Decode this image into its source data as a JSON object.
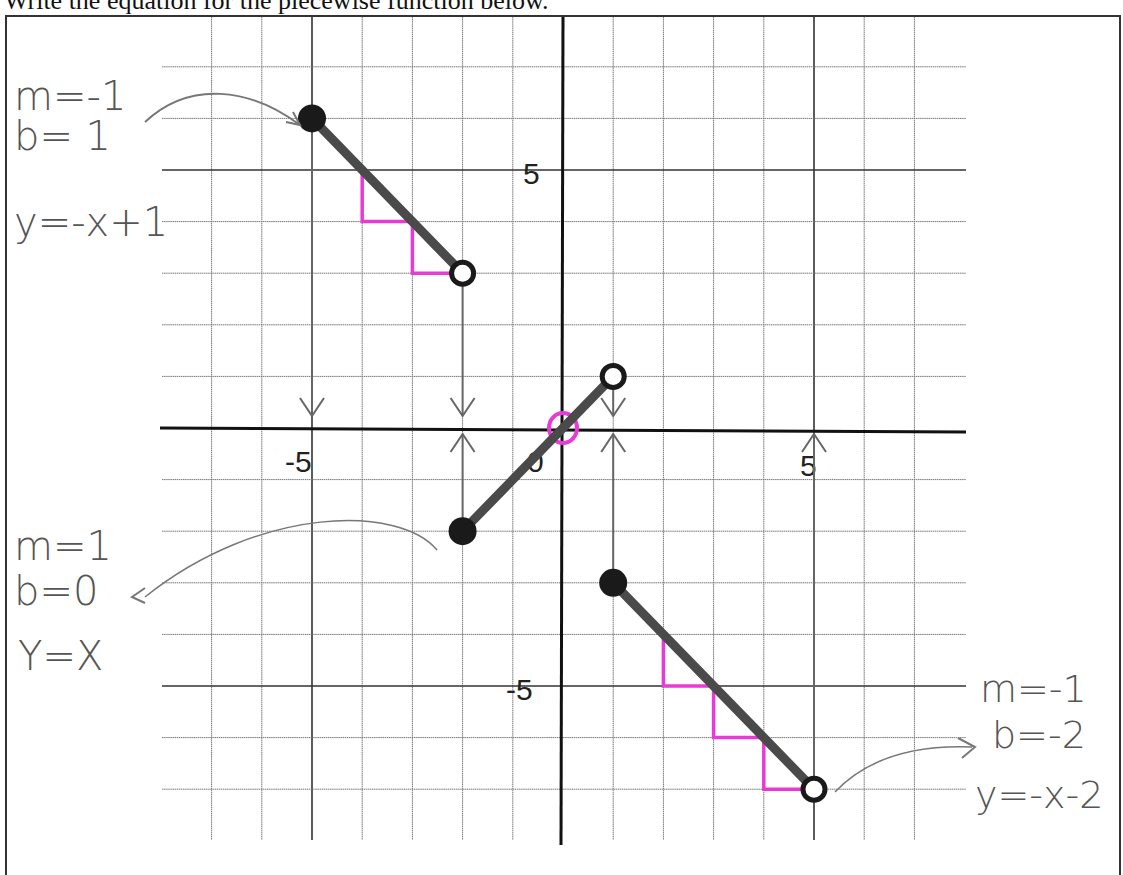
{
  "prompt": "Write the equation for the piecewise function below.",
  "chart_data": {
    "type": "line",
    "title": "Write the equation for the piecewise function below.",
    "xlabel": "",
    "ylabel": "",
    "xlim": [
      -8,
      8
    ],
    "ylim": [
      -8,
      8
    ],
    "grid": true,
    "tick_labels": {
      "x": [
        "-5",
        "0",
        "5"
      ],
      "y": [
        "5",
        "-5"
      ]
    },
    "series": [
      {
        "name": "piece 1",
        "x": [
          -5,
          -2
        ],
        "y": [
          6,
          3
        ],
        "start": "closed",
        "end": "open",
        "equation": "y=-x+1",
        "m": "-1",
        "b": "1"
      },
      {
        "name": "piece 2",
        "x": [
          -2,
          1
        ],
        "y": [
          -2,
          1
        ],
        "start": "closed",
        "end": "open",
        "equation": "y=x",
        "m": "1",
        "b": "0"
      },
      {
        "name": "piece 3",
        "x": [
          1,
          5
        ],
        "y": [
          -3,
          -7
        ],
        "start": "closed",
        "end": "open",
        "equation": "y=-x-2",
        "m": "-1",
        "b": "-2"
      }
    ],
    "annotations": {
      "slope_steps_piece1": [
        [
          -4,
          5
        ],
        [
          -4,
          4
        ],
        [
          -3,
          4
        ],
        [
          -3,
          3
        ],
        [
          -2,
          3
        ]
      ],
      "slope_steps_piece3": [
        [
          2,
          -4
        ],
        [
          2,
          -5
        ],
        [
          3,
          -5
        ],
        [
          3,
          -6
        ],
        [
          4,
          -6
        ],
        [
          4,
          -7
        ],
        [
          5,
          -7
        ]
      ],
      "intercept_circle": [
        0,
        0
      ],
      "domain_arrows_x": [
        -5,
        -2,
        1,
        5
      ]
    }
  },
  "notes": {
    "piece1": {
      "m": "m=-1",
      "b": "b= 1",
      "eq": "y=-x+1"
    },
    "piece2": {
      "m": "m=1",
      "b": "b=0",
      "eq": "Y=X"
    },
    "piece3": {
      "m": "m=-1",
      "b": "b=-2",
      "eq": "y=-x-2"
    }
  },
  "colors": {
    "segment": "#4a4a4a",
    "points": "#1a1a1a",
    "highlight": "#e83ad6",
    "grid": "#777777",
    "handwriting": "#555555"
  }
}
